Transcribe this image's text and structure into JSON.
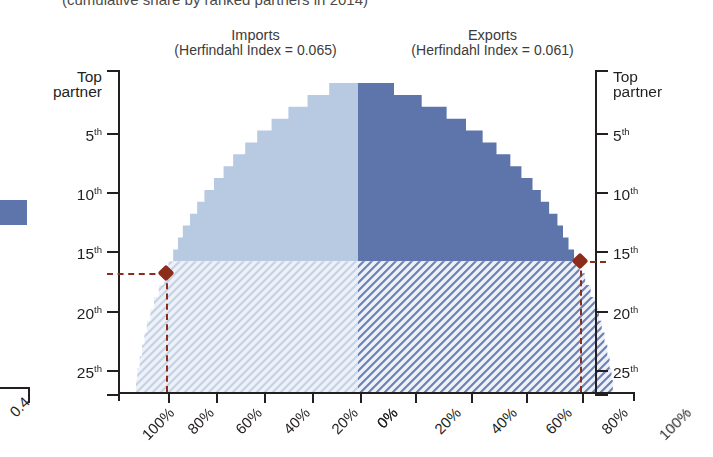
{
  "figure": {
    "clipped_subtitle": "(cumulative share by ranked partners in 2014)",
    "neighbor_axis_label": "0.4"
  },
  "headers": {
    "imports": {
      "main": "Imports",
      "sub": "(Herfindahl Index = 0.065)"
    },
    "exports": {
      "main": "Exports",
      "sub": "(Herfindahl Index = 0.061)"
    }
  },
  "axes": {
    "y_left": {
      "labels": [
        "Top partner",
        "5th",
        "10th",
        "15th",
        "20th",
        "25th"
      ],
      "ranks": [
        1,
        5,
        10,
        15,
        20,
        25
      ]
    },
    "y_right": {
      "labels": [
        "Top partner",
        "5th",
        "10th",
        "15th",
        "20th",
        "25th"
      ],
      "ranks": [
        1,
        5,
        10,
        15,
        20,
        25
      ]
    },
    "x_left": [
      "100%",
      "80%",
      "60%",
      "40%",
      "20%",
      "0%"
    ],
    "x_right": [
      "0%",
      "20%",
      "40%",
      "60%",
      "80%",
      "100%"
    ]
  },
  "colors": {
    "imports_solid": "#b8c9e2",
    "imports_hatch_bg": "#eef2f8",
    "imports_hatch_line": "#c3d3e7",
    "exports_solid": "#5e75ac",
    "exports_hatch_bg": "#eef2f8",
    "exports_hatch_line": "#6b82b4",
    "annotation": "#8c2d1c",
    "axis": "#231f20"
  },
  "annotation": {
    "imports_marker": {
      "rank": 16,
      "share_pct": 80
    },
    "exports_marker": {
      "rank": 15,
      "share_pct": 80
    }
  },
  "chart_data": {
    "type": "area",
    "subtitle": "(cumulative share by ranked partners in 2014)",
    "xlabel": "",
    "ylabel": "Partner rank",
    "orientation": "horizontal-mirrored",
    "ylim": [
      1,
      27
    ],
    "xlim": [
      0,
      100
    ],
    "grid": false,
    "legend": "none",
    "highlight_rank_divider": 15,
    "series": [
      {
        "name": "Imports",
        "side": "left",
        "herfindahl_index": 0.065,
        "units": "cumulative % of total imports",
        "ranks": [
          1,
          2,
          3,
          4,
          5,
          6,
          7,
          8,
          9,
          10,
          11,
          12,
          13,
          14,
          15,
          16,
          17,
          18,
          19,
          20,
          21,
          22,
          23,
          24,
          25,
          26
        ],
        "cumulative_share_pct": [
          12,
          21,
          29,
          36,
          42,
          47,
          52,
          56,
          60,
          64,
          67,
          70,
          73,
          75,
          77,
          79,
          81,
          83,
          85,
          86.5,
          88,
          89,
          90,
          91,
          92,
          92.5
        ]
      },
      {
        "name": "Exports",
        "side": "right",
        "herfindahl_index": 0.061,
        "units": "cumulative % of total exports",
        "ranks": [
          1,
          2,
          3,
          4,
          5,
          6,
          7,
          8,
          9,
          10,
          11,
          12,
          13,
          14,
          15,
          16,
          17,
          18,
          19,
          20,
          21,
          22,
          23,
          24,
          25,
          26
        ],
        "cumulative_share_pct": [
          13,
          23,
          32,
          39,
          45,
          50,
          55,
          59,
          63,
          66,
          69,
          72,
          74,
          76,
          78,
          80,
          82,
          84,
          85.5,
          87,
          88,
          89,
          90,
          90.8,
          91.5,
          92
        ]
      }
    ],
    "annotations": [
      {
        "label": "Imports 80% reached at 16th partner",
        "rank": 16,
        "share_pct": 80
      },
      {
        "label": "Exports 80% reached at 15th partner",
        "rank": 15,
        "share_pct": 80
      }
    ]
  }
}
